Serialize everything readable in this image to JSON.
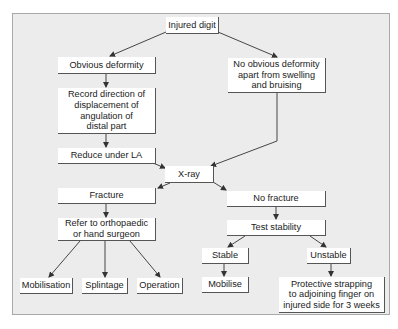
{
  "diagram": {
    "type": "flowchart",
    "nodes": {
      "injured_digit": "Injured digit",
      "obvious_deformity": "Obvious deformity",
      "record_direction": "Record direction of\ndisplacement of\nangulation of\ndistal part",
      "reduce_under_la": "Reduce under LA",
      "no_obvious_deformity": "No obvious deformity\napart from swelling\nand bruising",
      "xray": "X-ray",
      "fracture": "Fracture",
      "refer": "Refer to orthopaedic\nor hand surgeon",
      "mobilisation": "Mobilisation",
      "splintage": "Splintage",
      "operation": "Operation",
      "no_fracture": "No fracture",
      "test_stability": "Test stability",
      "stable": "Stable",
      "unstable": "Unstable",
      "mobilise": "Mobilise",
      "protective_strapping": "Protective strapping\nto adjoining finger on\ninjured side for 3 weeks"
    },
    "edges": [
      [
        "injured_digit",
        "obvious_deformity"
      ],
      [
        "injured_digit",
        "no_obvious_deformity"
      ],
      [
        "obvious_deformity",
        "record_direction"
      ],
      [
        "record_direction",
        "reduce_under_la"
      ],
      [
        "reduce_under_la",
        "xray"
      ],
      [
        "no_obvious_deformity",
        "xray"
      ],
      [
        "xray",
        "fracture"
      ],
      [
        "xray",
        "no_fracture"
      ],
      [
        "fracture",
        "refer"
      ],
      [
        "refer",
        "mobilisation"
      ],
      [
        "refer",
        "splintage"
      ],
      [
        "refer",
        "operation"
      ],
      [
        "no_fracture",
        "test_stability"
      ],
      [
        "test_stability",
        "stable"
      ],
      [
        "test_stability",
        "unstable"
      ],
      [
        "stable",
        "mobilise"
      ],
      [
        "unstable",
        "protective_strapping"
      ]
    ],
    "colors": {
      "background": "#ececec",
      "box_fill": "#ffffff",
      "box_shadow": "#555555",
      "line": "#333333",
      "frame_border": "#a9a9a9"
    }
  }
}
